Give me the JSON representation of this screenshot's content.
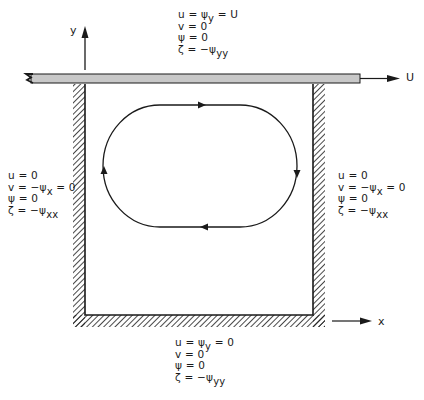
{
  "diagram": {
    "lid_velocity_label": "U",
    "x_axis_label": "x",
    "y_axis_label": "y",
    "colors": {
      "ink": "#1a1a1a",
      "lid_fill": "#c8c8c8",
      "background": "#ffffff"
    },
    "boundaries": {
      "top": {
        "lines": [
          {
            "lhs": "u",
            "eq": " = ψ",
            "sub": "y",
            "rhs": " = U"
          },
          {
            "lhs": "v",
            "eq": " = 0",
            "sub": "",
            "rhs": ""
          },
          {
            "lhs": "ψ",
            "eq": " = 0",
            "sub": "",
            "rhs": ""
          },
          {
            "lhs": "ζ",
            "eq": " = −ψ",
            "sub": "yy",
            "rhs": ""
          }
        ]
      },
      "left": {
        "lines": [
          {
            "lhs": "u",
            "eq": " = 0",
            "sub": "",
            "rhs": ""
          },
          {
            "lhs": "v",
            "eq": " = −ψ",
            "sub": "x",
            "rhs": " = 0"
          },
          {
            "lhs": "ψ",
            "eq": " = 0",
            "sub": "",
            "rhs": ""
          },
          {
            "lhs": "ζ",
            "eq": " = −ψ",
            "sub": "xx",
            "rhs": ""
          }
        ]
      },
      "right": {
        "lines": [
          {
            "lhs": "u",
            "eq": " = 0",
            "sub": "",
            "rhs": ""
          },
          {
            "lhs": "v",
            "eq": " = −ψ",
            "sub": "x",
            "rhs": " = 0"
          },
          {
            "lhs": "ψ",
            "eq": " = 0",
            "sub": "",
            "rhs": ""
          },
          {
            "lhs": "ζ",
            "eq": " = −ψ",
            "sub": "xx",
            "rhs": ""
          }
        ]
      },
      "bottom": {
        "lines": [
          {
            "lhs": "u",
            "eq": " = ψ",
            "sub": "y",
            "rhs": " = 0"
          },
          {
            "lhs": "v",
            "eq": " = 0",
            "sub": "",
            "rhs": ""
          },
          {
            "lhs": "ψ",
            "eq": " = 0",
            "sub": "",
            "rhs": ""
          },
          {
            "lhs": "ζ",
            "eq": " = −ψ",
            "sub": "yy",
            "rhs": ""
          }
        ]
      }
    },
    "streamline": {
      "direction": "clockwise",
      "arrows": [
        "top-right",
        "right-down",
        "bottom-left",
        "left-up"
      ]
    }
  }
}
